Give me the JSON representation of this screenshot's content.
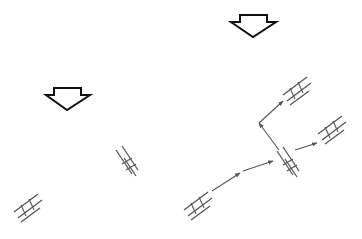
{
  "diagram": {
    "background": "#ffffff",
    "stroke_color": "#555555",
    "arrow_outline_color": "#111111",
    "panels": [
      {
        "name": "left-panel",
        "block_arrow": {
          "tip": [
            67,
            110
          ]
        },
        "ladders": [
          {
            "center": [
              28,
              206
            ]
          },
          {
            "center": [
              128,
              163
            ]
          }
        ],
        "connectors": []
      },
      {
        "name": "right-panel",
        "block_arrow": {
          "tip": [
            253,
            37
          ]
        },
        "ladders": [
          {
            "center": [
              198,
              204
            ]
          },
          {
            "center": [
              288,
              163
            ]
          },
          {
            "center": [
              297,
              88
            ]
          },
          {
            "center": [
              330,
              130
            ]
          }
        ],
        "connectors": [
          {
            "from": [
              212,
              192
            ],
            "to": [
              240,
              173
            ]
          },
          {
            "from": [
              243,
              171
            ],
            "to": [
              272,
              161
            ]
          },
          {
            "from": [
              278,
              150
            ],
            "to": [
              259,
              123
            ]
          },
          {
            "from": [
              259,
              123
            ],
            "to": [
              283,
              101
            ]
          },
          {
            "from": [
              295,
              150
            ],
            "to": [
              316,
              143
            ]
          }
        ]
      }
    ]
  }
}
